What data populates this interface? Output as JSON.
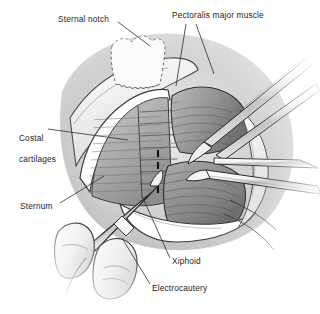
{
  "figure": {
    "modality": "grayscale line-and-wash surgical illustration",
    "background_color": "#ffffff",
    "ink_color": "#1d1d1d",
    "label_font_size_px": 8.3
  },
  "labels": [
    {
      "id": "sternal-notch",
      "text": "Sternal notch",
      "lines": [
        "Sternal notch"
      ],
      "x": 58,
      "y": 18,
      "anchor": "left"
    },
    {
      "id": "pectoralis",
      "text": "Pectoralis major muscle",
      "lines": [
        "Pectoralis major muscle"
      ],
      "x": 172,
      "y": 14,
      "anchor": "left"
    },
    {
      "id": "costal-cartilages",
      "text": "Costal cartilages",
      "lines": [
        "Costal",
        "cartilages"
      ],
      "x": 14,
      "y": 124,
      "anchor": "left"
    },
    {
      "id": "sternum",
      "text": "Sternum",
      "lines": [
        "Sternum"
      ],
      "x": 20,
      "y": 203,
      "anchor": "left"
    },
    {
      "id": "xiphoid",
      "text": "Xiphoid",
      "lines": [
        "Xiphoid"
      ],
      "x": 172,
      "y": 258,
      "anchor": "left"
    },
    {
      "id": "electrocautery",
      "text": "Electrocautery",
      "lines": [
        "Electrocautery"
      ],
      "x": 152,
      "y": 285,
      "anchor": "left"
    }
  ],
  "leader_lines": [
    {
      "for": "sternal-notch",
      "path": "M118,22 L150,46"
    },
    {
      "for": "pectoralis",
      "path": "M186,24 L176,86"
    },
    {
      "for": "pectoralis",
      "path": "M196,24 L214,74"
    },
    {
      "for": "costal-cartilages",
      "path": "M48,129 L128,140"
    },
    {
      "for": "sternum",
      "path": "M60,203 L104,176"
    },
    {
      "for": "xiphoid",
      "path": "M170,258 L142,196"
    },
    {
      "for": "electrocautery",
      "path": "M150,284 L122,238"
    }
  ],
  "anatomy": [
    {
      "id": "manubrium-outline",
      "name": "sternal notch / manubrium dashed outline",
      "style": "dashed"
    },
    {
      "id": "skin-drape",
      "name": "retracted skin and drape field",
      "style": "white wash"
    },
    {
      "id": "costal-field",
      "name": "costal cartilages, striated",
      "style": "mid grey hatch"
    },
    {
      "id": "pectoralis-left",
      "name": "left pectoralis major belly",
      "style": "grey striated"
    },
    {
      "id": "pectoralis-right",
      "name": "right pectoralis major belly",
      "style": "grey striated"
    },
    {
      "id": "midline-incision",
      "name": "midline incision marking",
      "style": "black dashed vertical"
    }
  ],
  "instruments": [
    {
      "id": "forceps-upper",
      "name": "long forceps entering from upper right"
    },
    {
      "id": "forceps-lower",
      "name": "second forceps / retractor blade"
    },
    {
      "id": "cautery-pencil",
      "name": "electrocautery pencil held in gloved hand"
    },
    {
      "id": "gloved-hand",
      "name": "surgeon gloved fingers, lower left"
    }
  ],
  "palette": {
    "ink": "#1d1d1d",
    "muscle_light": "#d8d8d8",
    "muscle_mid": "#9a9a9a",
    "muscle_dark": "#6e6e6e",
    "shadow": "#4a4a4a",
    "highlight": "#f2f2f2",
    "drape": "#fbfbfb"
  }
}
